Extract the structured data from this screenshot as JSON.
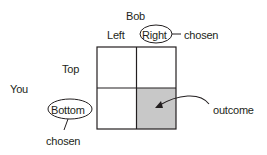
{
  "diagram": {
    "column_player": "Bob",
    "row_player": "You",
    "columns": [
      "Left",
      "Right"
    ],
    "rows": [
      "Top",
      "Bottom"
    ],
    "column_chosen": "Right",
    "row_chosen": "Bottom",
    "column_chosen_annotation": "chosen",
    "row_chosen_annotation": "chosen",
    "outcome_label": "outcome",
    "outcome_cell": {
      "row": "Bottom",
      "column": "Right"
    },
    "colors": {
      "line": "#231f20",
      "outcome_fill": "#c8c8c8",
      "background": "#ffffff"
    }
  }
}
